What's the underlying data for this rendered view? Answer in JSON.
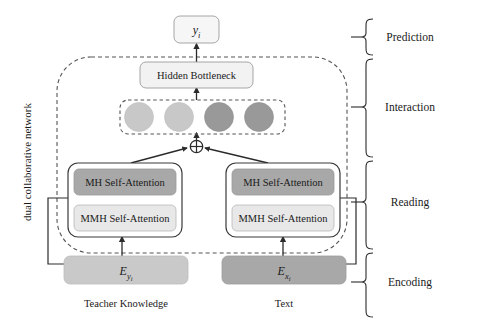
{
  "figure": {
    "side_label": "dual collaborative network"
  },
  "colors": {
    "background": "#ffffff",
    "stroke": "#3a3a3a",
    "text": "#1a1a1a",
    "light_fill": "#e8e8e8",
    "mid_light_fill": "#c9c9c9",
    "dark_fill": "#a8a8a8",
    "circle_light": "#c8c8c8",
    "circle_dark": "#999999",
    "dashed_stroke": "#555555"
  },
  "nodes": {
    "prediction_output": "y",
    "prediction_output_sub": "i",
    "bottleneck": "Hidden Bottleneck",
    "fusion_operator": "+",
    "left_branch": {
      "upper": "MH Self-Attention",
      "lower": "MMH Self-Attention",
      "encoding_base": "E",
      "encoding_sub": "y",
      "encoding_subsub": "i",
      "caption": "Teacher Knowledge"
    },
    "right_branch": {
      "upper": "MH Self-Attention",
      "lower": "MMH Self-Attention",
      "encoding_base": "E",
      "encoding_sub": "x",
      "encoding_subsub": "i",
      "caption": "Text"
    }
  },
  "interaction_tokens": [
    {
      "name": "token-1",
      "shade": "light"
    },
    {
      "name": "token-2",
      "shade": "light"
    },
    {
      "name": "token-3",
      "shade": "dark"
    },
    {
      "name": "token-4",
      "shade": "dark"
    }
  ],
  "stages": [
    {
      "id": "prediction",
      "label": "Prediction"
    },
    {
      "id": "interaction",
      "label": "Interaction"
    },
    {
      "id": "reading",
      "label": "Reading"
    },
    {
      "id": "encoding",
      "label": "Encoding"
    }
  ]
}
